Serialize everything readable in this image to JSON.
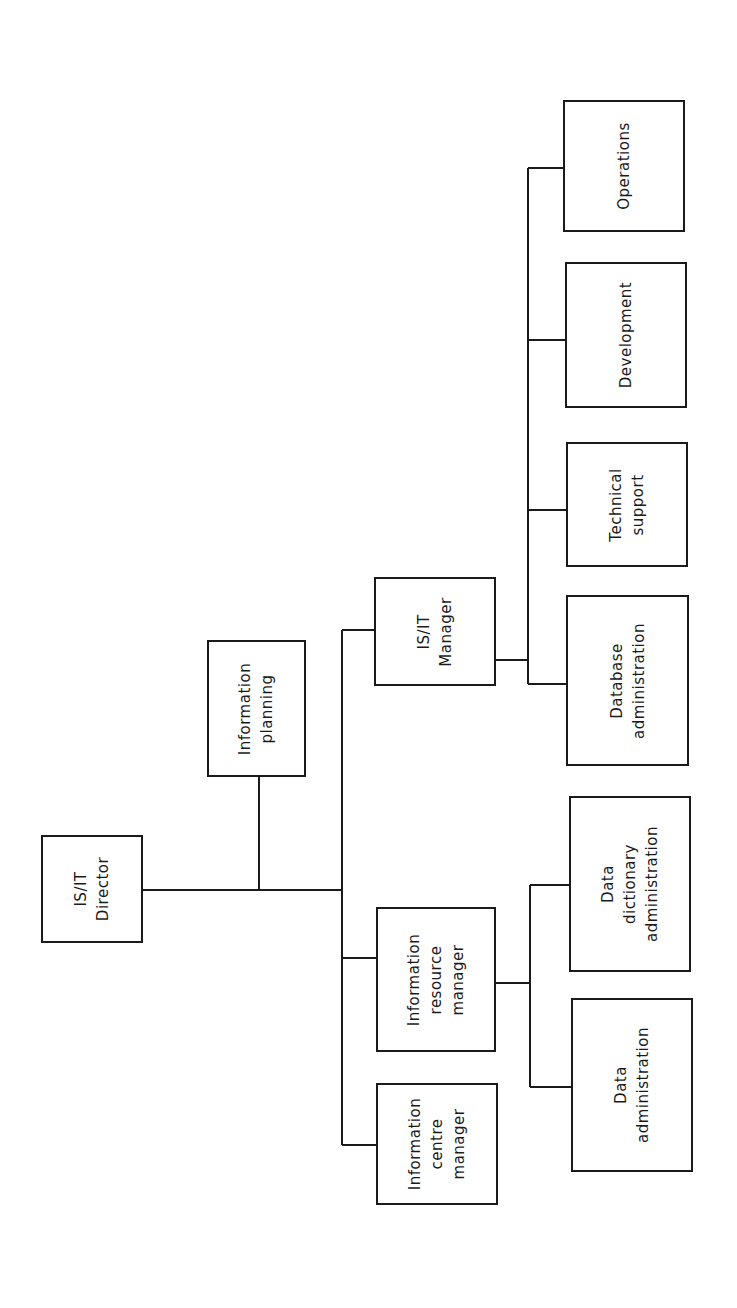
{
  "diagram": {
    "orientation": "rotated-90-ccw",
    "colors": {
      "stroke": "#1a1a1a",
      "background": "#ffffff"
    },
    "nodes": [
      {
        "id": "director",
        "label": "IS/IT\nDirector",
        "x": 41,
        "y": 835,
        "w": 102,
        "h": 108
      },
      {
        "id": "info-planning",
        "label": "Information\nplanning",
        "x": 207,
        "y": 640,
        "w": 99,
        "h": 137
      },
      {
        "id": "isit-manager",
        "label": "IS/IT\nManager",
        "x": 374,
        "y": 577,
        "w": 122,
        "h": 109
      },
      {
        "id": "info-resource-manager",
        "label": "Information\nresource\nmanager",
        "x": 376,
        "y": 907,
        "w": 120,
        "h": 145
      },
      {
        "id": "info-centre-manager",
        "label": "Information\ncentre\nmanager",
        "x": 376,
        "y": 1083,
        "w": 122,
        "h": 122
      },
      {
        "id": "operations",
        "label": "Operations",
        "x": 563,
        "y": 100,
        "w": 122,
        "h": 132
      },
      {
        "id": "development",
        "label": "Development",
        "x": 565,
        "y": 262,
        "w": 122,
        "h": 146
      },
      {
        "id": "technical-support",
        "label": "Technical\nsupport",
        "x": 566,
        "y": 442,
        "w": 122,
        "h": 125
      },
      {
        "id": "database-admin",
        "label": "Database\nadministration",
        "x": 566,
        "y": 595,
        "w": 123,
        "h": 171
      },
      {
        "id": "data-dictionary-admin",
        "label": "Data\ndictionary\nadministration",
        "x": 569,
        "y": 796,
        "w": 122,
        "h": 176
      },
      {
        "id": "data-admin",
        "label": "Data\nadministration",
        "x": 571,
        "y": 998,
        "w": 122,
        "h": 174
      }
    ],
    "edges": [
      {
        "from": "director",
        "to": "info-planning"
      },
      {
        "from": "director",
        "to": "isit-manager"
      },
      {
        "from": "director",
        "to": "info-resource-manager"
      },
      {
        "from": "director",
        "to": "info-centre-manager"
      },
      {
        "from": "isit-manager",
        "to": "operations"
      },
      {
        "from": "isit-manager",
        "to": "development"
      },
      {
        "from": "isit-manager",
        "to": "technical-support"
      },
      {
        "from": "isit-manager",
        "to": "database-admin"
      },
      {
        "from": "info-resource-manager",
        "to": "data-dictionary-admin"
      },
      {
        "from": "info-resource-manager",
        "to": "data-admin"
      }
    ],
    "lines": [
      {
        "x1": 143,
        "y1": 890,
        "x2": 342,
        "y2": 890
      },
      {
        "x1": 259,
        "y1": 777,
        "x2": 259,
        "y2": 890
      },
      {
        "x1": 342,
        "y1": 630,
        "x2": 342,
        "y2": 1145
      },
      {
        "x1": 342,
        "y1": 630,
        "x2": 374,
        "y2": 630
      },
      {
        "x1": 342,
        "y1": 958,
        "x2": 376,
        "y2": 958
      },
      {
        "x1": 342,
        "y1": 1145,
        "x2": 376,
        "y2": 1145
      },
      {
        "x1": 496,
        "y1": 660,
        "x2": 528,
        "y2": 660
      },
      {
        "x1": 528,
        "y1": 168,
        "x2": 528,
        "y2": 684
      },
      {
        "x1": 528,
        "y1": 168,
        "x2": 563,
        "y2": 168
      },
      {
        "x1": 528,
        "y1": 340,
        "x2": 565,
        "y2": 340
      },
      {
        "x1": 528,
        "y1": 510,
        "x2": 566,
        "y2": 510
      },
      {
        "x1": 528,
        "y1": 684,
        "x2": 566,
        "y2": 684
      },
      {
        "x1": 496,
        "y1": 983,
        "x2": 530,
        "y2": 983
      },
      {
        "x1": 530,
        "y1": 885,
        "x2": 530,
        "y2": 1087
      },
      {
        "x1": 530,
        "y1": 885,
        "x2": 569,
        "y2": 885
      },
      {
        "x1": 530,
        "y1": 1087,
        "x2": 571,
        "y2": 1087
      }
    ]
  }
}
